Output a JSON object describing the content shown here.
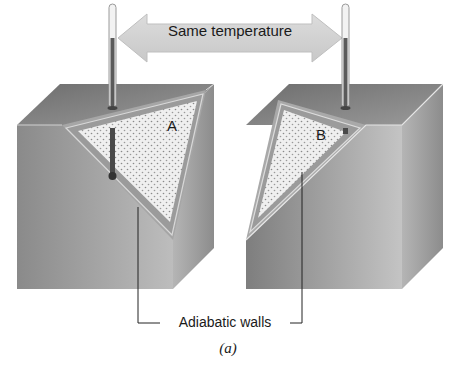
{
  "figure": {
    "arrow_label": "Same temperature",
    "system_a_label": "A",
    "system_b_label": "B",
    "walls_label": "Adiabatic walls",
    "caption": "(a)"
  },
  "colors": {
    "cube_front": "#8f8f8f",
    "cube_top": "#7a7a7a",
    "cube_side": "#a8a8a8",
    "wall_band": "#9c9c9c",
    "gas_fill": "#eeeeee",
    "gas_dots": "#8a8a8a",
    "arrow_fill": "#d4d4d4",
    "thermometer": "#555555"
  },
  "icons": {
    "thermometer_left": "thermometer-icon",
    "thermometer_right": "thermometer-icon",
    "double_arrow": "double-arrow-icon"
  }
}
